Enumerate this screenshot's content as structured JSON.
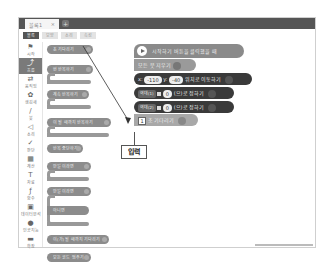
{
  "window": {
    "tab_title": "블록1",
    "tab_close": "×",
    "tab_add": "+"
  },
  "subtabs": [
    {
      "label": "블록",
      "active": true
    },
    {
      "label": "모양"
    },
    {
      "label": "소리"
    },
    {
      "label": "속성"
    }
  ],
  "categories": [
    {
      "label": "시작",
      "icon": "flag-icon",
      "glyph": "⚑"
    },
    {
      "label": "흐름",
      "icon": "flow-icon",
      "glyph": "⤴",
      "active": true
    },
    {
      "label": "움직임",
      "icon": "move-icon",
      "glyph": "⇄"
    },
    {
      "label": "생김새",
      "icon": "looks-icon",
      "glyph": "✿"
    },
    {
      "label": "붓",
      "icon": "brush-icon",
      "glyph": "∕"
    },
    {
      "label": "소리",
      "icon": "sound-icon",
      "glyph": "◁"
    },
    {
      "label": "판단",
      "icon": "judge-icon",
      "glyph": "✓"
    },
    {
      "label": "계산",
      "icon": "calc-icon",
      "glyph": "▦"
    },
    {
      "label": "자료",
      "icon": "data-icon",
      "glyph": "T"
    },
    {
      "label": "함수",
      "icon": "function-icon",
      "glyph": "ƒ"
    },
    {
      "label": "데이터분석",
      "icon": "analysis-icon",
      "glyph": "▣"
    },
    {
      "label": "인공지능",
      "icon": "ai-icon",
      "glyph": "●"
    },
    {
      "label": "확장",
      "icon": "extension-icon",
      "glyph": "▬"
    }
  ],
  "palette": {
    "b1": "초 기다리기",
    "b2": "번 반복하기",
    "b3": "계속 반복하기",
    "b4": "이 될 때까지 반복하기",
    "b5": "반복 중단하기",
    "b6": "만일 이라면",
    "b7": "만일 이라면",
    "b7_else": "아니면",
    "b8": "이(가) 될 때까지 기다리기",
    "b9": "모든 코드 멈추기"
  },
  "workspace": {
    "start": "시작하기 버튼을 클릭했을 때",
    "clear": "모든 붓 지우기",
    "move": {
      "x_label": "x:",
      "x": "-110",
      "y_label": "y:",
      "y": "-40",
      "text": "위치로 이동하기"
    },
    "var1": {
      "name": "역대(1)",
      "to": "를",
      "value": "0",
      "text": "(으)로 정하기"
    },
    "var2": {
      "name": "역대(2)",
      "to": "를",
      "value": "0",
      "text": "(으)로 정하기"
    },
    "wait": {
      "value": "1",
      "text": "초 기다리기"
    }
  },
  "callout": {
    "label": "입력"
  }
}
